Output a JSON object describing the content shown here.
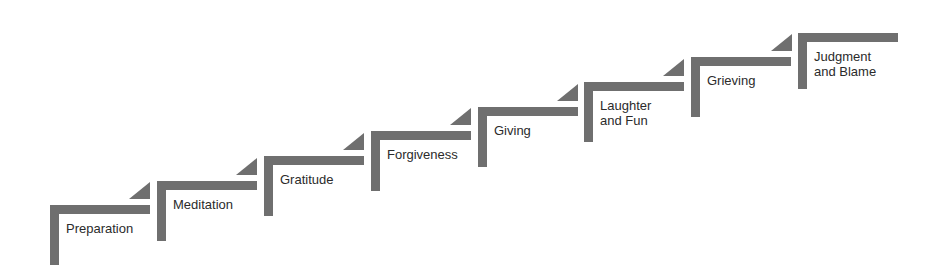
{
  "diagram": {
    "type": "staircase",
    "bar_color": "#6f6f6f",
    "steps": [
      {
        "label": "Preparation"
      },
      {
        "label": "Meditation"
      },
      {
        "label": "Gratitude"
      },
      {
        "label": "Forgiveness"
      },
      {
        "label": "Giving"
      },
      {
        "label": "Laughter\nand Fun"
      },
      {
        "label": "Grieving"
      },
      {
        "label": "Judgment\nand Blame"
      }
    ]
  }
}
